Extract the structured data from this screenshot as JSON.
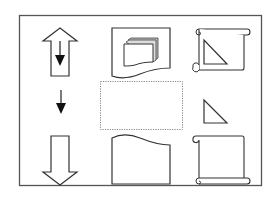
{
  "diagram": {
    "colors": {
      "stroke": "#333333",
      "fill": "#ffffff",
      "frame": "#555555",
      "dotted": "#888888",
      "page_shade": "#bbbbbb"
    },
    "icons": [
      {
        "id": "up-arrow-with-inner-down-arrow",
        "row": 1,
        "col": 1
      },
      {
        "id": "multi-page-document",
        "row": 1,
        "col": 2
      },
      {
        "id": "scroll-with-triangle",
        "row": 1,
        "col": 3
      },
      {
        "id": "small-down-arrow",
        "row": 2,
        "col": 1
      },
      {
        "id": "dotted-selection-box",
        "row": 2,
        "col": 2
      },
      {
        "id": "small-triangle",
        "row": 2,
        "col": 3
      },
      {
        "id": "hollow-down-arrow",
        "row": 3,
        "col": 1
      },
      {
        "id": "wavy-top-shape",
        "row": 3,
        "col": 2
      },
      {
        "id": "blank-scroll",
        "row": 3,
        "col": 3
      }
    ]
  }
}
